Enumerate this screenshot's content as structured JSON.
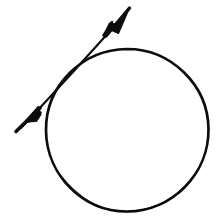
{
  "canvas": {
    "width": 218,
    "height": 221,
    "background_color": "#ffffff",
    "ink_color": "#0d0d0d"
  },
  "figure": {
    "style": "hand-drawn line art",
    "elements": [
      {
        "name": "circle",
        "shape": "circle",
        "center_x": 127,
        "center_y": 130,
        "radius": 81,
        "stroke_width": 2.6,
        "fill": "none",
        "stroke_color": "#0d0d0d"
      },
      {
        "name": "double-headed-arrow",
        "shape": "line",
        "from_x": 18,
        "from_y": 131,
        "to_x": 129,
        "to_y": 9,
        "angle_degrees": -47,
        "stroke_width": 2.2,
        "stroke_color": "#0d0d0d",
        "arrowhead_start": true,
        "arrowhead_end": true,
        "arrowhead_style": "barbed-dart"
      }
    ]
  },
  "geometry": {
    "circle_bounds": {
      "left": 46,
      "top": 49,
      "right": 208,
      "bottom": 211
    },
    "arrow_tip_upper_right": {
      "x": 129,
      "y": 9
    },
    "arrow_tip_lower_left": {
      "x": 18,
      "y": 131
    },
    "relation": "the arrow crosses the circle near its upper-left arc, forming a short chord"
  }
}
